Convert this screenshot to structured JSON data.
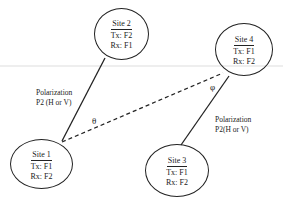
{
  "diagram": {
    "sites": [
      {
        "id": "site1",
        "name": "Site 1",
        "tx": "Tx: F1",
        "rx": "Rx: F2"
      },
      {
        "id": "site2",
        "name": "Site 2",
        "tx": "Tx: F2",
        "rx": "Rx: F1"
      },
      {
        "id": "site3",
        "name": "Site 3",
        "tx": "Tx: F1",
        "rx": "Rx: F2"
      },
      {
        "id": "site4",
        "name": "Site 4",
        "tx": "Tx: F1",
        "rx": "Rx: F2"
      }
    ],
    "links": [
      {
        "from": "Site 1",
        "to": "Site 2",
        "style": "solid",
        "label_line1": "Polarization",
        "label_line2": "P2 (H or V)"
      },
      {
        "from": "Site 3",
        "to": "Site 4",
        "style": "solid",
        "label_line1": "Polarization",
        "label_line2": "P2(H or V)"
      },
      {
        "from": "Site 1",
        "to": "Site 4",
        "style": "dashed",
        "label_line1": "",
        "label_line2": ""
      }
    ],
    "angles": {
      "theta": "θ",
      "phi": "φ"
    },
    "colors": {
      "line": "#222222",
      "background": "#ffffff",
      "guide_line": "#d0d0d0"
    }
  }
}
